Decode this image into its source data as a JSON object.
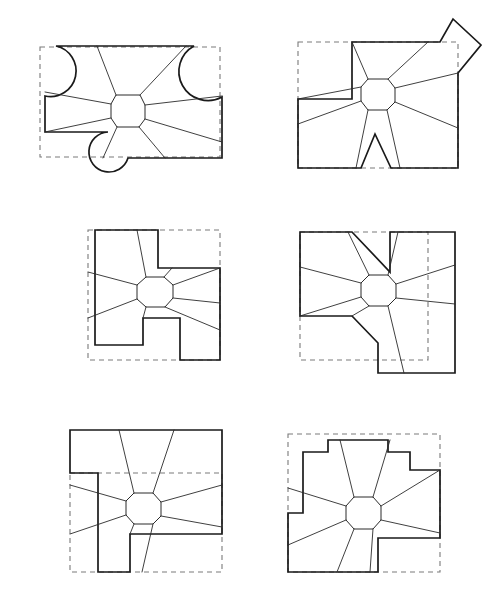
{
  "document": {
    "title": "Shape Deformation Figure Set",
    "background_color": "#ffffff",
    "width": 494,
    "height": 611,
    "figure_count": 6,
    "layout": "2 columns x 3 rows"
  },
  "style": {
    "solid_outline_color": "#1a1a1a",
    "dashed_outline_color": "#7a7a7a",
    "mesh_line_color": "#2a2a2a",
    "solid_outline_width": 1.7,
    "dashed_outline_width": 1.1,
    "mesh_line_width": 0.9,
    "dash_pattern": "5 4"
  },
  "chart_data": {
    "type": "diagram",
    "figures": [
      {
        "id": "figure-1",
        "position": "top-left",
        "label": "",
        "has_curved_boundary": true,
        "center": [
          128,
          111
        ],
        "octagon_radius": 17,
        "dashed_rect": {
          "x": 40,
          "y": 47,
          "width": 180,
          "height": 110
        },
        "solid_outline": "M 42,47 L 194,47 L 222,99 L 222,158 L 110,158 L 46,158 L 46,128 L 42,128 Z",
        "spokes": 8,
        "notes": "Two semicircular lobes at upper-left and upper-right, one circular lobe at lower-left of the boundary."
      },
      {
        "id": "figure-2",
        "position": "top-right",
        "label": "",
        "has_curved_boundary": false,
        "center": [
          378,
          94
        ],
        "octagon_radius": 17,
        "dashed_rect": {
          "x": 298,
          "y": 42,
          "width": 160,
          "height": 126
        },
        "spokes": 8,
        "notes": "Diamond-shaped spike protruding upper-right; V-shaped notch in lower boundary; step notch at left."
      },
      {
        "id": "figure-3",
        "position": "middle-left",
        "label": "",
        "has_curved_boundary": false,
        "center": [
          155,
          291
        ],
        "octagon_radius": 20,
        "dashed_rect": {
          "x": 88,
          "y": 230,
          "width": 132,
          "height": 130
        },
        "spokes": 8,
        "notes": "Cross / plus-like stepped outline with rectangular notch at bottom center and step at upper right."
      },
      {
        "id": "figure-4",
        "position": "middle-right",
        "label": "",
        "has_curved_boundary": false,
        "center": [
          378,
          290
        ],
        "octagon_radius": 20,
        "dashed_rect": {
          "x": 300,
          "y": 232,
          "width": 128,
          "height": 128
        },
        "spokes": 8,
        "notes": "Square outline with a thin wedge slit cut from upper boundary toward center and a stepped notch at lower left."
      },
      {
        "id": "figure-5",
        "position": "bottom-left",
        "label": "",
        "has_curved_boundary": false,
        "center": [
          143,
          509
        ],
        "octagon_radius": 19,
        "dashed_rect": {
          "x": 70,
          "y": 473,
          "width": 152,
          "height": 99
        },
        "spokes": 8,
        "notes": "Large rectangle with an L-shaped step cut out of the lower-left region."
      },
      {
        "id": "figure-6",
        "position": "bottom-right",
        "label": "",
        "has_curved_boundary": false,
        "center": [
          363,
          514
        ],
        "octagon_radius": 19,
        "dashed_rect": {
          "x": 288,
          "y": 434,
          "width": 152,
          "height": 138
        },
        "spokes": 8,
        "notes": "Stepped castellated upper boundary with notch at lower right."
      }
    ],
    "legend": [],
    "xlabel": "",
    "ylabel": "",
    "grid": false
  }
}
